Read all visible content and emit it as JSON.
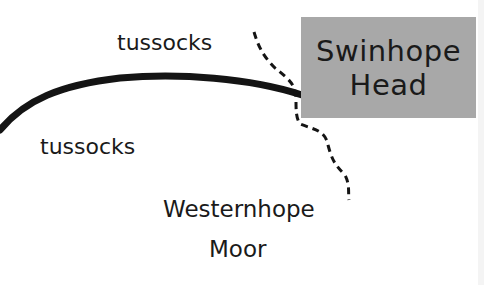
{
  "map": {
    "place_box": {
      "line1": "Swinhope",
      "line2": "Head",
      "fill": "#a8a8a8"
    },
    "labels": {
      "tussocks_north": "tussocks",
      "tussocks_south": "tussocks",
      "area_line1": "Westernhope",
      "area_line2": "Moor"
    },
    "features": {
      "track": "solid-thick-line",
      "boundary": "dashed-line"
    }
  }
}
